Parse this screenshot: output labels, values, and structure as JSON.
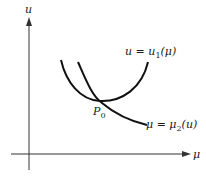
{
  "figure": {
    "axes": {
      "y_label": "u",
      "x_label": "μ"
    },
    "curves": [
      {
        "name": "u1",
        "label_lhs": "u = u",
        "label_sub": "1",
        "label_rhs": "(μ)"
      },
      {
        "name": "mu2",
        "label_lhs": "μ = μ",
        "label_sub": "2",
        "label_rhs": "(u)"
      }
    ],
    "point": {
      "label": "P",
      "sub": "0"
    },
    "colors": {
      "ink": "#1a1a1a",
      "axis": "#333333",
      "background": "#ffffff"
    }
  }
}
